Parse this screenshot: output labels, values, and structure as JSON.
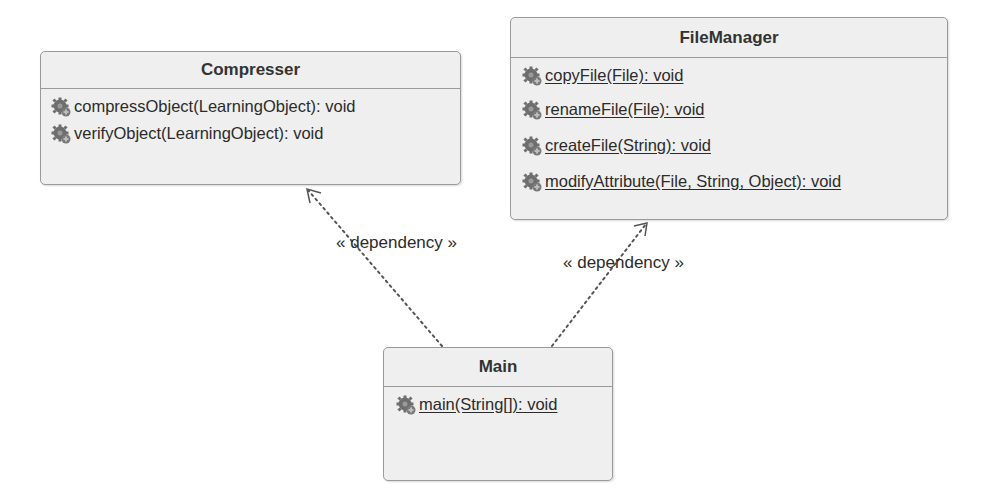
{
  "classes": {
    "compresser": {
      "name": "Compresser",
      "operations": [
        {
          "text": "compressObject(LearningObject): void",
          "static": false,
          "icon": "gear-icon"
        },
        {
          "text": "verifyObject(LearningObject): void",
          "static": false,
          "icon": "gear-icon"
        }
      ]
    },
    "filemanager": {
      "name": "FileManager",
      "operations": [
        {
          "text": "copyFile(File): void",
          "static": true,
          "icon": "gear-icon"
        },
        {
          "text": "renameFile(File): void",
          "static": true,
          "icon": "gear-icon"
        },
        {
          "text": "createFile(String): void",
          "static": true,
          "icon": "gear-icon"
        },
        {
          "text": "modifyAttribute(File, String, Object): void",
          "static": true,
          "icon": "gear-icon"
        }
      ]
    },
    "main": {
      "name": "Main",
      "operations": [
        {
          "text": "main(String[]): void",
          "static": true,
          "icon": "gear-icon"
        }
      ]
    }
  },
  "relations": [
    {
      "from": "Main",
      "to": "Compresser",
      "type": "dependency",
      "label": "« dependency »"
    },
    {
      "from": "Main",
      "to": "FileManager",
      "type": "dependency",
      "label": "« dependency »"
    }
  ],
  "colors": {
    "box_fill": "#efefef",
    "box_border": "#9a9a9a",
    "text": "#2b2b2b",
    "line": "#555555"
  }
}
